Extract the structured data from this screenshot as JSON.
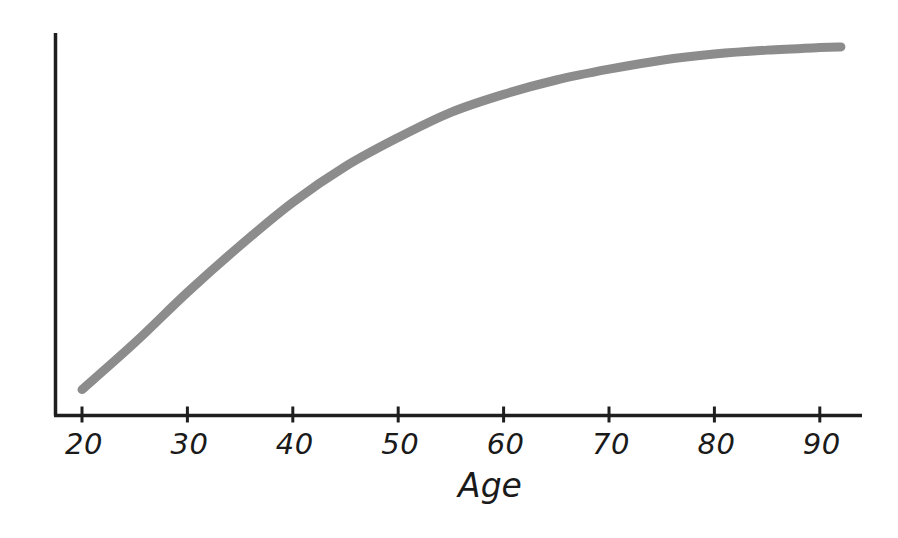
{
  "chart_data": {
    "type": "line",
    "title": "",
    "subtitle": "",
    "xlabel": "Age",
    "ylabel": "",
    "xlim": [
      20,
      92
    ],
    "ylim": [
      0,
      1
    ],
    "grid": false,
    "legend": false,
    "legend_position": "none",
    "x_ticks": [
      20,
      30,
      40,
      50,
      60,
      70,
      80,
      90
    ],
    "x_tick_labels": [
      "20",
      "30",
      "40",
      "50",
      "60",
      "70",
      "80",
      "90"
    ],
    "y_ticks": [],
    "y_tick_labels": [],
    "annotations": [],
    "series": [
      {
        "name": "curve",
        "color": "#8c8c8c",
        "line_width": 9,
        "x": [
          20,
          25,
          30,
          35,
          40,
          45,
          50,
          55,
          60,
          65,
          70,
          75,
          80,
          85,
          90,
          92
        ],
        "values": [
          0.04,
          0.17,
          0.31,
          0.44,
          0.56,
          0.66,
          0.74,
          0.81,
          0.86,
          0.9,
          0.93,
          0.955,
          0.972,
          0.983,
          0.99,
          0.992
        ]
      }
    ]
  },
  "axis": {
    "x_label": "Age",
    "ticks": [
      {
        "label": "20"
      },
      {
        "label": "30"
      },
      {
        "label": "40"
      },
      {
        "label": "50"
      },
      {
        "label": "60"
      },
      {
        "label": "70"
      },
      {
        "label": "80"
      },
      {
        "label": "90"
      }
    ]
  },
  "colors": {
    "background": "#ffffff",
    "axis": "#1f1f1f",
    "curve": "#8c8c8c",
    "text": "#1a1a1a"
  }
}
